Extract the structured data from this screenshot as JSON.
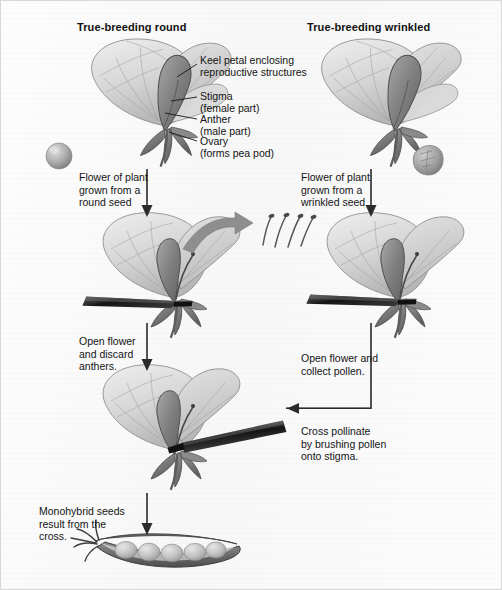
{
  "figure": {
    "background_color": "#fcfcfc",
    "border_color": "#d8d8d8",
    "ink_color": "#141414",
    "arrow_color": "#2b2b2b",
    "petal_color": "#cfcfcf",
    "keel_color": "#8c8c8c",
    "sepal_color": "#7a7a7a",
    "forceps_color": "#1d1d1d",
    "pod_color": "#9a9a9a",
    "pea_color": "#c9c9c9",
    "seed_round_color": "#a9a9a9",
    "seed_wrinkled_color": "#9d9d9d"
  },
  "headers": {
    "left": "True-breeding round",
    "right": "True-breeding wrinkled"
  },
  "anatomy_labels": [
    {
      "id": "keel",
      "text": "Keel petal enclosing\nreproductive structures"
    },
    {
      "id": "stigma",
      "text": "Stigma\n(female part)"
    },
    {
      "id": "anther",
      "text": "Anther\n(male part)"
    },
    {
      "id": "ovary",
      "text": "Ovary\n(forms pea pod)"
    }
  ],
  "captions": {
    "left_origin": "Flower of plant\ngrown from a\nround seed",
    "right_origin": "Flower of plant\ngrown from a\nwrinkled seed",
    "left_emasculate": "Open flower\nand discard\nanthers.",
    "right_collect": "Open flower and\ncollect pollen.",
    "cross_pollinate": "Cross pollinate\nby brushing pollen\nonto stigma.",
    "result": "Monohybrid seeds\nresult from the\ncross."
  },
  "objects": {
    "seed_round_name": "round-pea-seed",
    "seed_wrinkled_name": "wrinkled-pea-seed",
    "pod_pea_count": 5,
    "discarded_anther_count": 4
  }
}
